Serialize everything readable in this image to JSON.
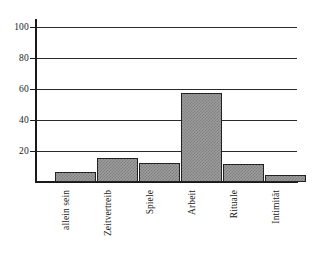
{
  "chart_data": {
    "type": "bar",
    "title": "",
    "subtitle": "",
    "xlabel": "",
    "ylabel": "",
    "categories": [
      "allein sein",
      "Zeitvertreib",
      "Spiele",
      "Arbeit",
      "Rituale",
      "Intimität"
    ],
    "values": [
      7,
      16,
      13,
      60,
      12,
      5
    ],
    "series": [
      {
        "name": "",
        "values": [
          7,
          16,
          13,
          60,
          12,
          5
        ]
      }
    ],
    "ylim": [
      0,
      105
    ],
    "yticks": [
      20,
      40,
      60,
      80,
      100
    ],
    "ytick_labels": [
      "20",
      "40",
      "60",
      "80",
      "100"
    ],
    "grid": true,
    "grid_axis": "y",
    "legend": false,
    "legend_position": "none",
    "bar_fill": "#9d9d9d",
    "bar_pattern": "checkered-gray",
    "bar_border": "#222222",
    "axis_color": "#1a1a1a",
    "background": "#ffffff",
    "label_rotation": -90,
    "annotations": []
  },
  "axis": {
    "ticks": [
      {
        "label": "100",
        "value": 100
      },
      {
        "label": "80",
        "value": 80
      },
      {
        "label": "60",
        "value": 60
      },
      {
        "label": "40",
        "value": 40
      },
      {
        "label": "20",
        "value": 20
      }
    ]
  }
}
